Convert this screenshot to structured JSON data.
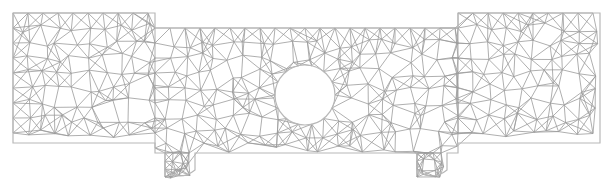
{
  "diagram": {
    "type": "finite-element-triangular-mesh",
    "stroke_color": "#9a9a9a",
    "background": "#ffffff",
    "regions": [
      {
        "name": "left-wing",
        "x": 13,
        "y": 13,
        "w": 142,
        "h": 130
      },
      {
        "name": "center-band",
        "x": 155,
        "y": 28,
        "w": 303,
        "h": 125
      },
      {
        "name": "right-wing",
        "x": 458,
        "y": 13,
        "w": 142,
        "h": 130
      },
      {
        "name": "left-tab",
        "x": 165,
        "y": 153,
        "w": 30,
        "h": 25
      },
      {
        "name": "right-tab",
        "x": 417,
        "y": 153,
        "w": 30,
        "h": 25
      }
    ],
    "hole": {
      "cx": 305,
      "cy": 95,
      "r": 30
    }
  }
}
